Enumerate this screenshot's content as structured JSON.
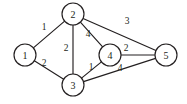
{
  "figure": {
    "name": "weighted-undirected-graph",
    "background_color": "#ffffff",
    "stroke_color": "#231f20",
    "width": 187,
    "height": 104
  },
  "chart_data": {
    "type": "diagram",
    "diagram_type": "weighted-undirected-graph",
    "title": "",
    "directed": false,
    "weighted": true,
    "node_count": 5,
    "edge_count": 8,
    "nodes": [
      {
        "id": "1",
        "label": "1",
        "x": 25,
        "y": 55,
        "r": 11
      },
      {
        "id": "2",
        "label": "2",
        "x": 73,
        "y": 14,
        "r": 11
      },
      {
        "id": "3",
        "label": "3",
        "x": 73,
        "y": 85,
        "r": 11
      },
      {
        "id": "4",
        "label": "4",
        "x": 110,
        "y": 55,
        "r": 11
      },
      {
        "id": "5",
        "label": "5",
        "x": 166,
        "y": 55,
        "r": 11
      }
    ],
    "edges": [
      {
        "source": "1",
        "target": "2",
        "weight": "1",
        "label_x": 44,
        "label_y": 27
      },
      {
        "source": "1",
        "target": "3",
        "weight": "2",
        "label_x": 44,
        "label_y": 63
      },
      {
        "source": "2",
        "target": "3",
        "weight": "2",
        "label_x": 66,
        "label_y": 48
      },
      {
        "source": "2",
        "target": "4",
        "weight": "4",
        "label_x": 88,
        "label_y": 34
      },
      {
        "source": "2",
        "target": "5",
        "weight": "3",
        "label_x": 127,
        "label_y": 21
      },
      {
        "source": "3",
        "target": "4",
        "weight": "1",
        "label_x": 91,
        "label_y": 67
      },
      {
        "source": "3",
        "target": "5",
        "weight": "4",
        "label_x": 120,
        "label_y": 68
      },
      {
        "source": "4",
        "target": "5",
        "weight": "2",
        "label_x": 126,
        "label_y": 48
      }
    ],
    "node_labels": [
      "1",
      "2",
      "3",
      "4",
      "5"
    ],
    "edge_weights": [
      "1",
      "2",
      "2",
      "4",
      "3",
      "1",
      "4",
      "2"
    ]
  }
}
